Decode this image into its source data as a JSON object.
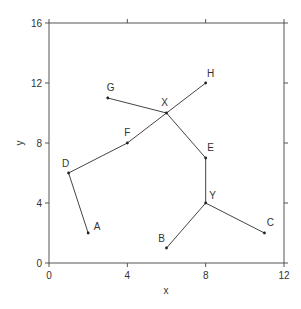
{
  "chart_data": {
    "type": "scatter",
    "title": "",
    "xlabel": "x",
    "ylabel": "y",
    "xlim": [
      0,
      12
    ],
    "ylim": [
      0,
      16
    ],
    "xticks": [
      "0",
      "4",
      "8",
      "12"
    ],
    "yticks": [
      "0",
      "4",
      "8",
      "12",
      "16"
    ],
    "grid": false,
    "points": [
      {
        "label": "A",
        "x": 2,
        "y": 2
      },
      {
        "label": "B",
        "x": 6,
        "y": 1
      },
      {
        "label": "C",
        "x": 11,
        "y": 2
      },
      {
        "label": "D",
        "x": 1,
        "y": 6
      },
      {
        "label": "E",
        "x": 8,
        "y": 7
      },
      {
        "label": "F",
        "x": 4,
        "y": 8
      },
      {
        "label": "G",
        "x": 3,
        "y": 11
      },
      {
        "label": "H",
        "x": 8,
        "y": 12
      },
      {
        "label": "X",
        "x": 6,
        "y": 10
      },
      {
        "label": "Y",
        "x": 8,
        "y": 4
      }
    ],
    "edges": [
      [
        "A",
        "D"
      ],
      [
        "D",
        "F"
      ],
      [
        "F",
        "X"
      ],
      [
        "X",
        "H"
      ],
      [
        "G",
        "X"
      ],
      [
        "X",
        "E"
      ],
      [
        "E",
        "Y"
      ],
      [
        "Y",
        "B"
      ],
      [
        "Y",
        "C"
      ]
    ]
  }
}
